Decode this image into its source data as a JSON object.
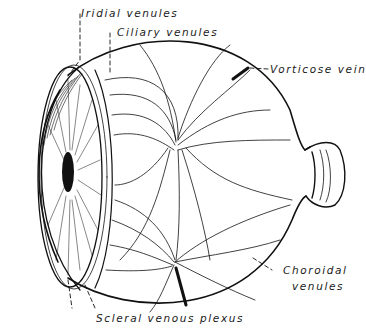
{
  "diagram": {
    "labels": {
      "iridial_venules": "Iridial venules",
      "ciliary_venules": "Ciliary venules",
      "vorticose_vein": "Vorticose vein",
      "choroidal_venules_line1": "Choroidal",
      "choroidal_venules_line2": "venules",
      "scleral_venous_plexus": "Scleral venous plexus"
    },
    "colors": {
      "ink": "#111111",
      "background": "#ffffff"
    }
  }
}
